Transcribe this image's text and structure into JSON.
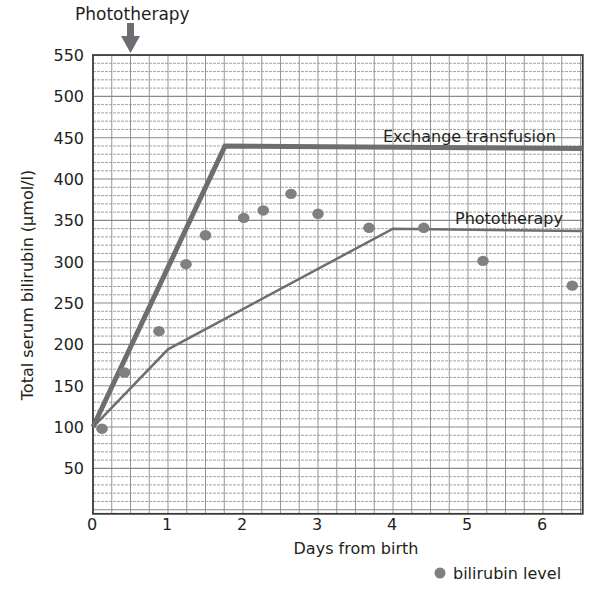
{
  "chart_data": {
    "type": "line",
    "title": "",
    "xlabel": "Days from birth",
    "ylabel": "Total serum bilirubin (µmol/l)",
    "xlim": [
      0,
      6.53
    ],
    "ylim": [
      -5,
      550
    ],
    "x_ticks": [
      0,
      1,
      2,
      3,
      4,
      5,
      6
    ],
    "x_tick_labels": [
      "0",
      "1",
      "2",
      "3",
      "4",
      "5",
      "6"
    ],
    "y_ticks": [
      50,
      100,
      150,
      200,
      250,
      300,
      350,
      400,
      450,
      500,
      550
    ],
    "y_tick_labels": [
      "50",
      "100",
      "150",
      "200",
      "250",
      "300",
      "350",
      "400",
      "450",
      "500",
      "550"
    ],
    "grid": {
      "on": true,
      "x_minor_step": 0.25,
      "y_minor_step": 10,
      "color": "#8a8a8a"
    },
    "annotations": [
      {
        "text": "Phototherapy",
        "type": "arrow-label",
        "x": 0.5,
        "position": "above-plot",
        "note": "arrow pointing down at day 0.5"
      }
    ],
    "series": [
      {
        "name": "Exchange transfusion",
        "kind": "threshold-line",
        "color": "#6d6e71",
        "line_width": 5,
        "label_position": {
          "x": 5.3,
          "y": 455
        },
        "points": [
          [
            0,
            100
          ],
          [
            1.76,
            440
          ],
          [
            6.53,
            437
          ]
        ]
      },
      {
        "name": "Phototherapy",
        "kind": "threshold-line",
        "color": "#6d6e71",
        "line_width": 2.5,
        "label_position": {
          "x": 5.35,
          "y": 355
        },
        "points": [
          [
            0,
            100
          ],
          [
            1,
            194
          ],
          [
            4,
            340
          ],
          [
            6.53,
            337
          ]
        ]
      },
      {
        "name": "bilirubin level",
        "kind": "scatter",
        "color": "#808080",
        "points": [
          [
            0.12,
            98
          ],
          [
            0.42,
            166
          ],
          [
            0.88,
            216
          ],
          [
            1.24,
            297
          ],
          [
            1.5,
            332
          ],
          [
            2.01,
            353
          ],
          [
            2.27,
            362
          ],
          [
            2.64,
            382
          ],
          [
            3.0,
            358
          ],
          [
            3.68,
            341
          ],
          [
            4.41,
            341
          ],
          [
            5.2,
            301
          ],
          [
            6.39,
            271
          ]
        ]
      }
    ],
    "legend": {
      "position": "bottom-right",
      "entries": [
        {
          "label": "bilirubin level",
          "marker": "circle",
          "color": "#808080"
        }
      ]
    }
  },
  "labels": {
    "top_arrow_label": "Phototherapy",
    "exchange_label": "Exchange transfusion",
    "phototherapy_label": "Phototherapy",
    "xlabel": "Days from birth",
    "ylabel": "Total serum bilirubin (µmol/l)",
    "legend_label": "bilirubin level"
  }
}
